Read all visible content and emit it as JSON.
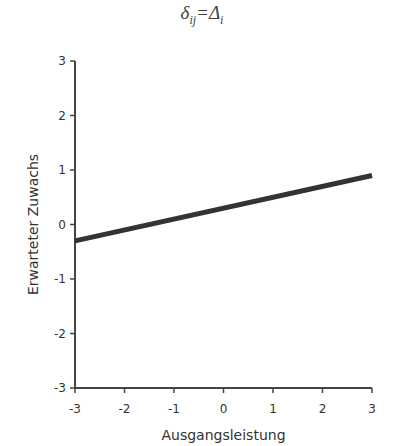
{
  "title": {
    "main": "δ",
    "sub": "ij",
    "eq": "=Δ",
    "sub2": "i"
  },
  "chart_data": {
    "type": "line",
    "title": "δij=Δi",
    "xlabel": "Ausgangsleistung",
    "ylabel": "Erwarteter Zuwachs",
    "xlim": [
      -3,
      3
    ],
    "ylim": [
      -3,
      3
    ],
    "xticks": [
      "-3",
      "-2",
      "-1",
      "0",
      "1",
      "2",
      "3"
    ],
    "yticks": [
      "3",
      "2",
      "1",
      "0",
      "-1",
      "-2",
      "-3"
    ],
    "grid": false,
    "legend": null,
    "series": [
      {
        "name": "Erwarteter Zuwachs",
        "x": [
          -3,
          3
        ],
        "y": [
          -0.3,
          0.9
        ],
        "color": "#333333"
      }
    ]
  }
}
